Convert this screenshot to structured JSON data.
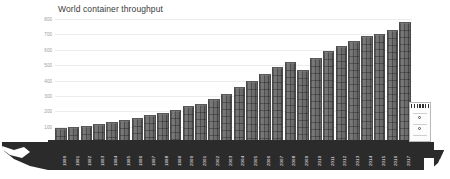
{
  "chart_data": {
    "type": "bar",
    "title": "World container throughput",
    "xlabel": "",
    "ylabel": "Million TEUs",
    "ylim": [
      0,
      800
    ],
    "yticks": [
      100,
      200,
      300,
      400,
      500,
      600,
      700,
      800
    ],
    "grid": true,
    "legend": "none",
    "categories": [
      "1990",
      "1991",
      "1992",
      "1993",
      "1994",
      "1995",
      "1996",
      "1997",
      "1998",
      "1999",
      "2000",
      "2001",
      "2002",
      "2003",
      "2004",
      "2005",
      "2006",
      "2007",
      "2008",
      "2009",
      "2010",
      "2011",
      "2012",
      "2013",
      "2014",
      "2015",
      "2016",
      "2017"
    ],
    "values": [
      88,
      96,
      104,
      116,
      128,
      145,
      158,
      178,
      190,
      210,
      235,
      248,
      280,
      315,
      360,
      400,
      440,
      490,
      520,
      470,
      545,
      590,
      625,
      655,
      690,
      700,
      730,
      780
    ],
    "units": "Million TEUs",
    "series": [
      {
        "name": "World container throughput",
        "values": [
          88,
          96,
          104,
          116,
          128,
          145,
          158,
          178,
          190,
          210,
          235,
          248,
          280,
          315,
          360,
          400,
          440,
          490,
          520,
          470,
          545,
          590,
          625,
          655,
          690,
          700,
          730,
          780
        ]
      }
    ]
  },
  "colors": {
    "bar": "#6e6e6e",
    "bar_edge": "#4a4a4a",
    "grid": "#ececec",
    "hull": "#2b2b2b",
    "background": "#ffffff",
    "title_text": "#3a3a3a",
    "tick_text": "#9a9a9a",
    "xlabel_text": "#f2f2f2",
    "superstructure": "#fcfcfc"
  },
  "ship": {
    "hull_label": "container-ship-hull",
    "bow_label": "ship-bow",
    "stern_label": "ship-stern",
    "superstructure_label": "ship-superstructure",
    "bridge_windows_label": "bridge-windows"
  }
}
